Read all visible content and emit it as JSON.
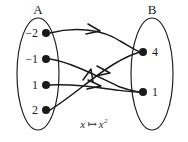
{
  "figure": {
    "caption_var": "x",
    "caption_arrow": "↦",
    "caption_expr": "x",
    "caption_exponent": "2",
    "caption_full": "x ↦ x²",
    "ink_color": "#1a1a1a",
    "background_color": "#ffffff"
  },
  "domain_set": {
    "name": "A",
    "elements": [
      {
        "label": "−2",
        "value": -2
      },
      {
        "label": "−1",
        "value": -1
      },
      {
        "label": "1",
        "value": 1
      },
      {
        "label": "2",
        "value": 2
      }
    ]
  },
  "codomain_set": {
    "name": "B",
    "elements": [
      {
        "label": "4",
        "value": 4
      },
      {
        "label": "1",
        "value": 1
      }
    ]
  },
  "mappings": [
    {
      "from": "−2",
      "to": "4"
    },
    {
      "from": "−1",
      "to": "1"
    },
    {
      "from": "1",
      "to": "1"
    },
    {
      "from": "2",
      "to": "4"
    }
  ]
}
